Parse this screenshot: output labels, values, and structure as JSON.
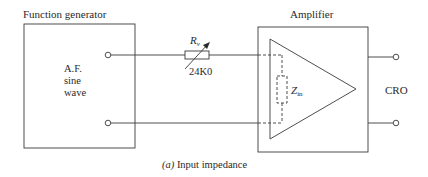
{
  "figure": {
    "caption_prefix": "(a)",
    "caption_text": " Input impedance"
  },
  "function_generator": {
    "title": "Function generator",
    "body_lines": [
      "A.F.",
      "sine",
      "wave"
    ]
  },
  "resistor": {
    "symbol": "R",
    "subscript": "v",
    "value": "24K0",
    "icon": "variable-resistor-icon"
  },
  "amplifier": {
    "title": "Amplifier",
    "impedance_symbol": "Z",
    "impedance_subscript": "in",
    "icon": "amplifier-triangle-icon"
  },
  "output": {
    "label": "CRO"
  },
  "colors": {
    "line": "#3a3a3a",
    "text": "#2a2a2a",
    "background": "#ffffff"
  }
}
